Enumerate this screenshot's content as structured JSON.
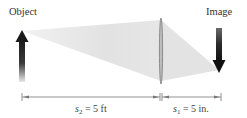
{
  "labels": {
    "object": "Object",
    "image": "Image"
  },
  "dimensions": {
    "object_distance": {
      "symbol": "s",
      "subscript": "2",
      "equals": "= 5 ft"
    },
    "image_distance": {
      "symbol": "s",
      "subscript": "1",
      "equals": "= 5 in."
    }
  },
  "colors": {
    "arrow_dark": "#1a1a1a",
    "beam": "#e4e4e4",
    "lens": "#888888",
    "dimension_line": "#777777",
    "text": "#333333"
  },
  "elements": {
    "object_arrow": "upward-arrow",
    "lens": "converging-lens",
    "image_arrow": "downward-arrow"
  }
}
